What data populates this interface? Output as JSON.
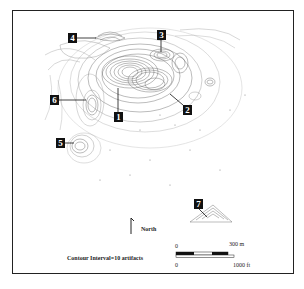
{
  "map": {
    "site_labels": [
      {
        "id": "1",
        "x": 114,
        "y": 112
      },
      {
        "id": "2",
        "x": 183,
        "y": 105
      },
      {
        "id": "3",
        "x": 157,
        "y": 30
      },
      {
        "id": "4",
        "x": 68,
        "y": 33
      },
      {
        "id": "5",
        "x": 56,
        "y": 138
      },
      {
        "id": "6",
        "x": 50,
        "y": 95
      },
      {
        "id": "7",
        "x": 194,
        "y": 199
      }
    ],
    "north_label": "North",
    "contour_note": "Contour Interval=10 artifacts",
    "scale": {
      "metric_zero": "0",
      "metric_max": "300 m",
      "imperial_zero": "0",
      "imperial_max": "1000 ft"
    }
  }
}
